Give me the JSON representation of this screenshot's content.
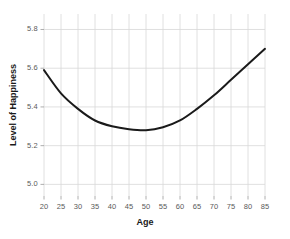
{
  "chart_data": {
    "type": "line",
    "title": "",
    "subtitle": "",
    "xlabel": "Age",
    "ylabel": "Level of Happiness",
    "xlim": [
      20,
      85
    ],
    "ylim": [
      4.94,
      5.88
    ],
    "xticks": [
      20,
      25,
      30,
      35,
      40,
      45,
      50,
      55,
      60,
      65,
      70,
      75,
      80,
      85
    ],
    "xtick_labels": [
      "20",
      "25",
      "30",
      "35",
      "40",
      "45",
      "50",
      "55",
      "60",
      "65",
      "70",
      "75",
      "80",
      "85"
    ],
    "yticks": [
      5.0,
      5.2,
      5.4,
      5.6,
      5.8
    ],
    "ytick_labels": [
      "5.0",
      "5.2",
      "5.4",
      "5.6",
      "5.8"
    ],
    "grid": true,
    "grid_color": "#d8d8d8",
    "legend": null,
    "legend_position": "none",
    "series": [
      {
        "name": "Level of Happiness",
        "color": "#1a1a1a",
        "line_width": 2,
        "x": [
          20,
          25,
          30,
          35,
          40,
          45,
          50,
          55,
          60,
          65,
          70,
          75,
          80,
          85
        ],
        "values": [
          5.59,
          5.47,
          5.39,
          5.33,
          5.3,
          5.285,
          5.28,
          5.295,
          5.33,
          5.39,
          5.46,
          5.54,
          5.62,
          5.7
        ]
      }
    ],
    "annotations": []
  },
  "axis_text": {
    "x_label": "Age",
    "y_label": "Level of Happiness"
  },
  "colors": {
    "background": "#ffffff",
    "line": "#1a1a1a",
    "grid": "#d8d8d8",
    "tick_text": "#5a5a5a",
    "label_text": "#1a1a1a"
  }
}
